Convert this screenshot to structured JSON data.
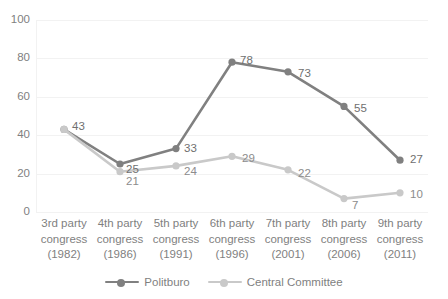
{
  "chart_data": {
    "type": "line",
    "title": "",
    "xlabel": "",
    "ylabel": "",
    "ylim": [
      0,
      100
    ],
    "ytick_values": [
      0,
      20,
      40,
      60,
      80,
      100
    ],
    "ytick_labels": [
      "0",
      "20",
      "40",
      "60",
      "80",
      "100"
    ],
    "grid": true,
    "legend_position": "bottom",
    "categories": [
      "3rd party congress (1982)",
      "4th party congress (1986)",
      "5th party congress (1991)",
      "6th party congress (1996)",
      "7th party congress (2001)",
      "8th party congress (2006)",
      "9th party congress (2011)"
    ],
    "category_lines": [
      [
        "3rd party",
        "congress",
        "(1982)"
      ],
      [
        "4th party",
        "congress",
        "(1986)"
      ],
      [
        "5th party",
        "congress",
        "(1991)"
      ],
      [
        "6th party",
        "congress",
        "(1996)"
      ],
      [
        "7th party",
        "congress",
        "(2001)"
      ],
      [
        "8th party",
        "congress",
        "(2006)"
      ],
      [
        "9th party",
        "congress",
        "(2011)"
      ]
    ],
    "series": [
      {
        "name": "Politburo",
        "color": "#808080",
        "values": [
          43,
          25,
          33,
          78,
          73,
          55,
          27
        ],
        "labels": [
          "43",
          "25",
          "33",
          "78",
          "73",
          "55",
          "27"
        ]
      },
      {
        "name": "Central Committee",
        "color": "#c9c9c9",
        "values": [
          43,
          21,
          24,
          29,
          22,
          7,
          10
        ],
        "labels": [
          "43",
          "21",
          "24",
          "29",
          "22",
          "7",
          "10"
        ]
      }
    ]
  },
  "legend": {
    "items": [
      {
        "label": "Politburo",
        "color": "#808080"
      },
      {
        "label": "Central Committee",
        "color": "#c9c9c9"
      }
    ]
  },
  "axis": {
    "y_labels": [
      "100",
      "80",
      "60",
      "40",
      "20",
      "0"
    ]
  }
}
